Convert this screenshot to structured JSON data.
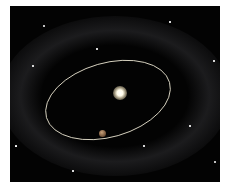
{
  "scene": {
    "description": "Star with planet on elliptical orbit inside a dusty debris disk",
    "background_color": "#030303",
    "orbit_color": "#d8d2c0",
    "star_color": "#fffbe8",
    "planet_color": "#a07a55"
  },
  "orbit": {
    "cx": 108,
    "cy": 100,
    "rx": 64,
    "ry": 38,
    "rotation": -18
  },
  "stars": [
    {
      "x": 34,
      "y": 20,
      "r": 1
    },
    {
      "x": 87,
      "y": 43,
      "r": 0.8
    },
    {
      "x": 23,
      "y": 60,
      "r": 0.8
    },
    {
      "x": 204,
      "y": 55,
      "r": 0.8
    },
    {
      "x": 160,
      "y": 16,
      "r": 0.7
    },
    {
      "x": 134,
      "y": 140,
      "r": 0.8
    },
    {
      "x": 205,
      "y": 156,
      "r": 1
    },
    {
      "x": 63,
      "y": 165,
      "r": 0.7
    },
    {
      "x": 180,
      "y": 120,
      "r": 0.7
    },
    {
      "x": 6,
      "y": 140,
      "r": 0.6
    }
  ]
}
